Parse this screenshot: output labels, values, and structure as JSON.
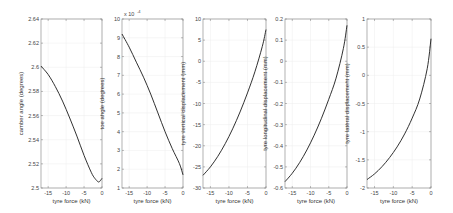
{
  "chart_data": [
    {
      "type": "line",
      "xlabel": "tyre force (kN)",
      "ylabel": "camber angle (degrees)",
      "xlim": [
        -17,
        0
      ],
      "ylim": [
        2.5,
        2.64
      ],
      "xticks": [
        "-15",
        "-10",
        "-5",
        "0"
      ],
      "yticks": [
        "2.5",
        "2.52",
        "2.54",
        "2.56",
        "2.58",
        "2.6",
        "2.62",
        "2.64"
      ],
      "x": [
        -17,
        -15,
        -13,
        -11,
        -9,
        -7,
        -5,
        -3,
        -2,
        -1,
        -0.5,
        0
      ],
      "y": [
        2.601,
        2.594,
        2.584,
        2.572,
        2.558,
        2.543,
        2.527,
        2.513,
        2.508,
        2.505,
        2.506,
        2.508
      ]
    },
    {
      "type": "line",
      "xlabel": "tyre force (kN)",
      "ylabel": "toe angle (degrees)",
      "y_multiplier": "x 10^-4",
      "xlim": [
        -17,
        0
      ],
      "ylim": [
        1,
        10
      ],
      "xticks": [
        "-15",
        "-10",
        "-5",
        "0"
      ],
      "yticks": [
        "1",
        "2",
        "3",
        "4",
        "5",
        "6",
        "7",
        "8",
        "9",
        "10"
      ],
      "x": [
        -17,
        -15,
        -13,
        -11,
        -9,
        -7,
        -5,
        -3,
        -1,
        0
      ],
      "y": [
        9.2,
        8.5,
        7.7,
        6.9,
        6.0,
        5.0,
        4.0,
        3.1,
        2.3,
        1.7
      ]
    },
    {
      "type": "line",
      "xlabel": "tyre force (kN)",
      "ylabel": "tyre vertical displacement (mm)",
      "xlim": [
        -17,
        0
      ],
      "ylim": [
        -30,
        10
      ],
      "xticks": [
        "-15",
        "-10",
        "-5",
        "0"
      ],
      "yticks": [
        "-30",
        "-25",
        "-20",
        "-15",
        "-10",
        "-5",
        "0",
        "5",
        "10"
      ],
      "x": [
        -17,
        -15,
        -13,
        -11,
        -9,
        -7,
        -5,
        -3,
        -1,
        0
      ],
      "y": [
        -27,
        -25,
        -22.5,
        -19.5,
        -16,
        -12,
        -7.5,
        -2.5,
        3.5,
        7.5
      ]
    },
    {
      "type": "line",
      "xlabel": "tyre force (kN)",
      "ylabel": "tyre longitudinal displacement (mm)",
      "xlim": [
        -17,
        0
      ],
      "ylim": [
        -0.6,
        0.2
      ],
      "xticks": [
        "-15",
        "-10",
        "-5",
        "0"
      ],
      "yticks": [
        "-0.6",
        "-0.5",
        "-0.4",
        "-0.3",
        "-0.2",
        "-0.1",
        "0",
        "0.1",
        "0.2"
      ],
      "x": [
        -17,
        -15,
        -13,
        -11,
        -9,
        -7,
        -5,
        -3,
        -1,
        0
      ],
      "y": [
        -0.57,
        -0.53,
        -0.48,
        -0.42,
        -0.35,
        -0.27,
        -0.18,
        -0.08,
        0.06,
        0.17
      ]
    },
    {
      "type": "line",
      "xlabel": "tyre force (kN)",
      "ylabel": "tyre lateral displacement (mm)",
      "xlim": [
        -17,
        0
      ],
      "ylim": [
        -2,
        1
      ],
      "xticks": [
        "-15",
        "-10",
        "-5",
        "0"
      ],
      "yticks": [
        "-2",
        "-1.5",
        "-1",
        "-0.5",
        "0",
        "0.5",
        "1"
      ],
      "x": [
        -17,
        -15,
        -13,
        -11,
        -9,
        -7,
        -5,
        -3,
        -1,
        0
      ],
      "y": [
        -1.85,
        -1.75,
        -1.62,
        -1.46,
        -1.27,
        -1.04,
        -0.76,
        -0.42,
        0.12,
        0.65
      ]
    }
  ],
  "panels": [
    {
      "ylabel": "camber angle (degrees)",
      "xlabel": "tyre force (kN)"
    },
    {
      "ylabel": "toe angle (degrees)",
      "xlabel": "tyre force (kN)",
      "multiplier": "x 10"
    },
    {
      "ylabel": "tyre vertical displacement (mm)",
      "xlabel": "tyre force (kN)"
    },
    {
      "ylabel": "tyre longitudinal displacement (mm)",
      "xlabel": "tyre force (kN)"
    },
    {
      "ylabel": "tyre lateral displacement (mm)",
      "xlabel": "tyre force (kN)"
    }
  ],
  "colors": {
    "line": "#1a1a1a",
    "axis": "#7f7f7f",
    "grid": "#ececec"
  }
}
